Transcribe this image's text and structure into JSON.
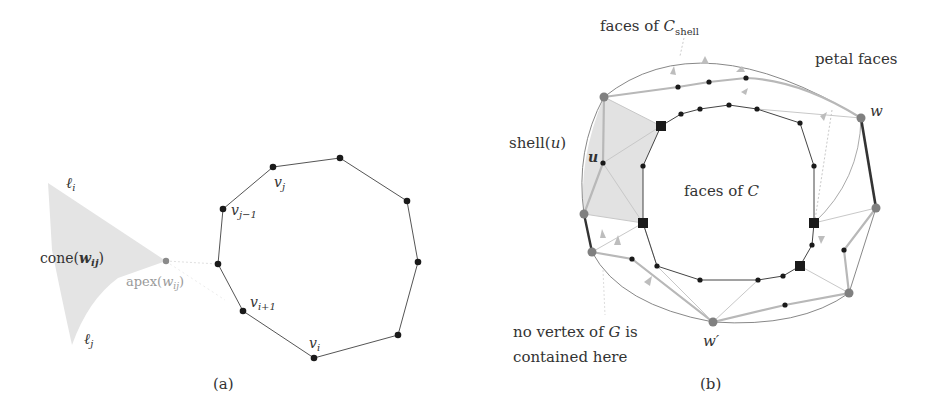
{
  "figure": {
    "panel_a": {
      "caption": "(a)",
      "labels": {
        "l_i_base": "ℓ",
        "l_i_sub": "i",
        "l_j_base": "ℓ",
        "l_j_sub": "j",
        "cone_pre": "cone(",
        "cone_var": "w",
        "cone_sub": "ij",
        "cone_post": ")",
        "apex_pre": "apex(",
        "apex_var": "w",
        "apex_sub": "ij",
        "apex_post": ")",
        "vj_base": "v",
        "vj_sub": "j",
        "vjm1_base": "v",
        "vjm1_sub": "j−1",
        "vip1_base": "v",
        "vip1_sub": "i+1",
        "vi_base": "v",
        "vi_sub": "i"
      },
      "polygon_vertices": [
        [
          273,
          167
        ],
        [
          340,
          158
        ],
        [
          407,
          201
        ],
        [
          418,
          262
        ],
        [
          398,
          335
        ],
        [
          314,
          358
        ],
        [
          243,
          311
        ],
        [
          218,
          264
        ],
        [
          223,
          209
        ]
      ],
      "apex_point": [
        166,
        261
      ]
    },
    "panel_b": {
      "caption": "(b)",
      "labels": {
        "faces_shell_pre": "faces of ",
        "faces_shell_var": "C",
        "faces_shell_sub": "shell",
        "petal_faces": "petal faces",
        "shell_u": "shell(",
        "shell_u_var": "u",
        "shell_u_post": ")",
        "u": "u",
        "faces_of_c_pre": "faces of ",
        "faces_of_c_var": "C",
        "w": "w",
        "w_prime": "w′",
        "no_vertex_line1_pre": "no vertex of ",
        "no_vertex_line1_var": "G",
        "no_vertex_line1_post": " is",
        "no_vertex_line2": "contained here"
      }
    },
    "colors": {
      "ink": "#333333",
      "node_black": "#1a1a1a",
      "node_gray": "#808080",
      "shade": "#e2e2e2",
      "light_edge": "#bdbdbd"
    }
  }
}
